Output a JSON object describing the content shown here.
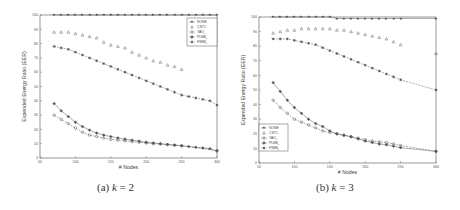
{
  "chart_data": [
    {
      "type": "line",
      "caption": "(a) k = 2",
      "caption_prefix": "(a)",
      "caption_var": "k",
      "caption_eq": "= 2",
      "title": "",
      "xlabel": "# Nodes",
      "ylabel": "Expended Energy Ratio (EER)",
      "xlim": [
        50,
        300
      ],
      "ylim": [
        0,
        100
      ],
      "xticks": [
        50,
        100,
        150,
        200,
        250,
        300
      ],
      "yticks": [
        0,
        10,
        20,
        30,
        40,
        50,
        60,
        70,
        80,
        90,
        100
      ],
      "grid": false,
      "legend_position": "upper right",
      "x": [
        70,
        80,
        90,
        100,
        110,
        120,
        130,
        140,
        150,
        160,
        170,
        180,
        190,
        200,
        210,
        220,
        230,
        240,
        250,
        260,
        270,
        280,
        290,
        300
      ],
      "series": [
        {
          "name": "NONE",
          "marker": "star",
          "line": "solid",
          "values": [
            100,
            100,
            100,
            100,
            100,
            100,
            100,
            100,
            100,
            100,
            100,
            100,
            100,
            100,
            100,
            100,
            100,
            100,
            100,
            100,
            100,
            100,
            100,
            100
          ]
        },
        {
          "name": "CSTC",
          "marker": "triangle",
          "line": "none",
          "values": [
            88,
            88,
            88,
            87,
            86,
            85,
            84,
            81,
            79,
            78,
            77,
            74,
            72,
            70,
            68,
            67,
            65,
            64,
            62,
            null,
            null,
            null,
            null,
            null
          ]
        },
        {
          "name": "YAO_k",
          "marker": "circle",
          "line": "dashed",
          "values": [
            30,
            27,
            24,
            21,
            18,
            16,
            15,
            14,
            13,
            12.5,
            12,
            11.5,
            11,
            10.5,
            10,
            9.7,
            9.3,
            9,
            8.7,
            null,
            null,
            null,
            null,
            5
          ]
        },
        {
          "name": "PLBB_k",
          "marker": "diamond",
          "line": "solid",
          "values": [
            38,
            33,
            29,
            25,
            22,
            19.5,
            17.5,
            16,
            15,
            14,
            13.2,
            12.5,
            11.8,
            11,
            10.5,
            10,
            9.5,
            9,
            8.5,
            8,
            7.5,
            7,
            6.5,
            5
          ]
        },
        {
          "name": "FSBB_k",
          "marker": "asterisk",
          "line": "dashed",
          "values": [
            78,
            77,
            76,
            74,
            72,
            70,
            68,
            66,
            64,
            62,
            60,
            58,
            56,
            54,
            52,
            50,
            48,
            46,
            44,
            43,
            42,
            41,
            40,
            37
          ]
        }
      ]
    },
    {
      "type": "line",
      "caption": "(b) k = 3",
      "caption_prefix": "(b)",
      "caption_var": "k",
      "caption_eq": "= 3",
      "title": "",
      "xlabel": "# Nodes",
      "ylabel": "Expended Energy Ratio (EER)",
      "xlim": [
        50,
        300
      ],
      "ylim": [
        0,
        100
      ],
      "xticks": [
        50,
        100,
        150,
        200,
        250,
        300
      ],
      "yticks": [
        0,
        10,
        20,
        30,
        40,
        50,
        60,
        70,
        80,
        90,
        100
      ],
      "grid": false,
      "legend_position": "lower left",
      "x": [
        70,
        80,
        90,
        100,
        110,
        120,
        130,
        140,
        150,
        160,
        170,
        180,
        190,
        200,
        210,
        220,
        230,
        240,
        250,
        260,
        270,
        280,
        290,
        300
      ],
      "series": [
        {
          "name": "NONE",
          "marker": "star",
          "line": "solid",
          "values": [
            100,
            100,
            100,
            100,
            100,
            100,
            100,
            100,
            100,
            99,
            99,
            99,
            99,
            99,
            99,
            99,
            99,
            99,
            99,
            null,
            null,
            null,
            null,
            99
          ]
        },
        {
          "name": "CSTC",
          "marker": "triangle",
          "line": "none",
          "values": [
            89,
            90,
            91,
            91,
            92,
            92,
            92,
            92,
            92,
            91,
            91,
            90,
            89,
            88,
            87,
            86,
            85,
            83,
            81,
            null,
            null,
            null,
            null,
            75
          ]
        },
        {
          "name": "YAO_k",
          "marker": "circle",
          "line": "dashed",
          "values": [
            43,
            38,
            34,
            30,
            28,
            26,
            24,
            22,
            21,
            20,
            19,
            18,
            17,
            16,
            15,
            14.5,
            14,
            13,
            12,
            null,
            null,
            null,
            null,
            8
          ]
        },
        {
          "name": "PLBB_k",
          "marker": "diamond",
          "line": "solid",
          "values": [
            55,
            49,
            43,
            38,
            34,
            30,
            27,
            25,
            22,
            20,
            19,
            18,
            16.5,
            15,
            14,
            13,
            12.5,
            11.5,
            10.5,
            null,
            null,
            null,
            null,
            8
          ]
        },
        {
          "name": "FSBB_k",
          "marker": "asterisk",
          "line": "dashed",
          "values": [
            85,
            85,
            85,
            84,
            83,
            82,
            81,
            79,
            77,
            75,
            73,
            71,
            69,
            67,
            65,
            63,
            61,
            59,
            57,
            null,
            null,
            null,
            null,
            50
          ]
        }
      ]
    }
  ]
}
